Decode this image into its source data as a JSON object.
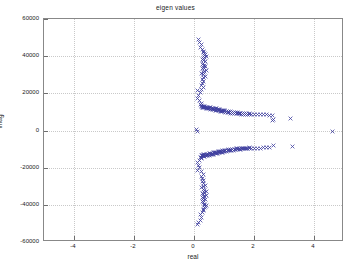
{
  "figure": {
    "title": "eigen values",
    "background_color": "#ffffff",
    "axes_color": "#888888",
    "grid_color": "#c9c9c9",
    "marker_color": "#4040a0",
    "marker_symbol": "x",
    "text_color": "#1a1a1a"
  },
  "axis_labels": {
    "x": "real",
    "y": "imag"
  },
  "chart_data": {
    "type": "scatter",
    "title": "eigen values",
    "xlabel": "real",
    "ylabel": "imag",
    "xlim": [
      -5,
      5
    ],
    "ylim": [
      -60000,
      60000
    ],
    "grid": true,
    "legend": false,
    "legend_position": "none",
    "xticks": [
      -4,
      -2,
      0,
      2,
      4
    ],
    "xticklabels": [
      "-4",
      "-2",
      "0",
      "2",
      "4"
    ],
    "yticks": [
      -60000,
      -40000,
      -20000,
      0,
      20000,
      40000,
      60000
    ],
    "yticklabels": [
      "-60000",
      "-40000",
      "-20000",
      "0",
      "20000",
      "40000",
      "60000"
    ],
    "marker": "x",
    "marker_color": "#4040a0",
    "series": [
      {
        "name": "eigenvalues",
        "points": [
          [
            0.14,
            49100
          ],
          [
            0.19,
            47600
          ],
          [
            0.25,
            46300
          ],
          [
            0.22,
            44900
          ],
          [
            0.29,
            43600
          ],
          [
            0.33,
            42600
          ],
          [
            0.31,
            41900
          ],
          [
            0.36,
            41300
          ],
          [
            0.38,
            40700
          ],
          [
            0.35,
            40200
          ],
          [
            0.4,
            39800
          ],
          [
            0.34,
            39300
          ],
          [
            0.3,
            38700
          ],
          [
            0.28,
            38100
          ],
          [
            0.33,
            37500
          ],
          [
            0.37,
            36900
          ],
          [
            0.31,
            36300
          ],
          [
            0.27,
            35700
          ],
          [
            0.35,
            35100
          ],
          [
            0.39,
            34600
          ],
          [
            0.33,
            34100
          ],
          [
            0.29,
            33600
          ],
          [
            0.36,
            33100
          ],
          [
            0.41,
            32500
          ],
          [
            0.34,
            31900
          ],
          [
            0.3,
            31300
          ],
          [
            0.26,
            30600
          ],
          [
            0.32,
            29900
          ],
          [
            0.37,
            29100
          ],
          [
            0.31,
            28300
          ],
          [
            0.27,
            27400
          ],
          [
            0.33,
            26500
          ],
          [
            0.29,
            25500
          ],
          [
            0.24,
            24400
          ],
          [
            0.3,
            23200
          ],
          [
            0.26,
            22000
          ],
          [
            0.13,
            21500
          ],
          [
            0.2,
            20600
          ],
          [
            0.16,
            19000
          ],
          [
            0.11,
            17400
          ],
          [
            0.19,
            15900
          ],
          [
            0.24,
            14600
          ],
          [
            0.21,
            13900
          ],
          [
            0.26,
            13400
          ],
          [
            0.3,
            13100
          ],
          [
            0.34,
            12900
          ],
          [
            0.28,
            12800
          ],
          [
            0.24,
            12700
          ],
          [
            0.38,
            12600
          ],
          [
            0.42,
            12500
          ],
          [
            0.33,
            12450
          ],
          [
            0.29,
            12400
          ],
          [
            0.46,
            12350
          ],
          [
            0.5,
            12300
          ],
          [
            0.36,
            12250
          ],
          [
            0.31,
            12200
          ],
          [
            0.54,
            12150
          ],
          [
            0.58,
            12100
          ],
          [
            0.4,
            12050
          ],
          [
            0.44,
            12000
          ],
          [
            0.62,
            11950
          ],
          [
            0.66,
            11900
          ],
          [
            0.48,
            11850
          ],
          [
            0.52,
            11800
          ],
          [
            0.7,
            11700
          ],
          [
            0.74,
            11600
          ],
          [
            0.56,
            11550
          ],
          [
            0.6,
            11500
          ],
          [
            0.78,
            11400
          ],
          [
            0.82,
            11300
          ],
          [
            0.64,
            11250
          ],
          [
            0.68,
            11200
          ],
          [
            0.86,
            11100
          ],
          [
            0.9,
            11000
          ],
          [
            0.72,
            10950
          ],
          [
            0.76,
            10900
          ],
          [
            0.94,
            10800
          ],
          [
            0.98,
            10700
          ],
          [
            0.8,
            10650
          ],
          [
            0.84,
            10600
          ],
          [
            1.02,
            10500
          ],
          [
            1.08,
            10400
          ],
          [
            0.88,
            10350
          ],
          [
            0.92,
            10300
          ],
          [
            1.14,
            10200
          ],
          [
            1.2,
            10100
          ],
          [
            0.96,
            10050
          ],
          [
            1.0,
            10000
          ],
          [
            1.26,
            9900
          ],
          [
            1.32,
            9800
          ],
          [
            1.05,
            9750
          ],
          [
            1.1,
            9700
          ],
          [
            1.38,
            9600
          ],
          [
            1.44,
            9500
          ],
          [
            1.15,
            9450
          ],
          [
            1.22,
            9400
          ],
          [
            1.5,
            9350
          ],
          [
            1.56,
            9300
          ],
          [
            1.28,
            9250
          ],
          [
            1.34,
            9200
          ],
          [
            1.62,
            9150
          ],
          [
            1.68,
            9100
          ],
          [
            1.4,
            9050
          ],
          [
            1.46,
            9000
          ],
          [
            1.76,
            8950
          ],
          [
            1.84,
            8900
          ],
          [
            1.52,
            8880
          ],
          [
            1.58,
            8860
          ],
          [
            1.92,
            8840
          ],
          [
            2.0,
            8800
          ],
          [
            1.64,
            8780
          ],
          [
            1.7,
            8760
          ],
          [
            2.1,
            8700
          ],
          [
            2.22,
            8650
          ],
          [
            1.78,
            8620
          ],
          [
            1.86,
            8600
          ],
          [
            2.3,
            8550
          ],
          [
            2.42,
            8450
          ],
          [
            2.52,
            8300
          ],
          [
            2.62,
            7900
          ],
          [
            2.66,
            6100
          ],
          [
            2.6,
            5300
          ],
          [
            3.22,
            6200
          ],
          [
            4.62,
            -500
          ],
          [
            0.08,
            400
          ],
          [
            0.1,
            -600
          ],
          [
            0.14,
            -49600
          ],
          [
            0.11,
            -50800
          ],
          [
            0.2,
            -48200
          ],
          [
            0.25,
            -46800
          ],
          [
            0.22,
            -45400
          ],
          [
            0.29,
            -44100
          ],
          [
            0.33,
            -43000
          ],
          [
            0.31,
            -42300
          ],
          [
            0.36,
            -41700
          ],
          [
            0.39,
            -41100
          ],
          [
            0.35,
            -40600
          ],
          [
            0.41,
            -40100
          ],
          [
            0.34,
            -39600
          ],
          [
            0.3,
            -39000
          ],
          [
            0.28,
            -38400
          ],
          [
            0.33,
            -37800
          ],
          [
            0.37,
            -37200
          ],
          [
            0.31,
            -36600
          ],
          [
            0.27,
            -36000
          ],
          [
            0.35,
            -35400
          ],
          [
            0.4,
            -34900
          ],
          [
            0.33,
            -34400
          ],
          [
            0.29,
            -33900
          ],
          [
            0.36,
            -33400
          ],
          [
            0.42,
            -32800
          ],
          [
            0.34,
            -32200
          ],
          [
            0.3,
            -31600
          ],
          [
            0.26,
            -30900
          ],
          [
            0.32,
            -30200
          ],
          [
            0.38,
            -29400
          ],
          [
            0.31,
            -28600
          ],
          [
            0.27,
            -27700
          ],
          [
            0.33,
            -26800
          ],
          [
            0.29,
            -25800
          ],
          [
            0.24,
            -24700
          ],
          [
            0.3,
            -23500
          ],
          [
            0.26,
            -22300
          ],
          [
            0.13,
            -21300
          ],
          [
            0.18,
            -20100
          ],
          [
            0.15,
            -18700
          ],
          [
            0.11,
            -17200
          ],
          [
            0.19,
            -16200
          ],
          [
            0.24,
            -15300
          ],
          [
            0.21,
            -14700
          ],
          [
            0.26,
            -14300
          ],
          [
            0.3,
            -14000
          ],
          [
            0.34,
            -13800
          ],
          [
            0.28,
            -13700
          ],
          [
            0.24,
            -13600
          ],
          [
            0.38,
            -13500
          ],
          [
            0.42,
            -13400
          ],
          [
            0.33,
            -13350
          ],
          [
            0.29,
            -13300
          ],
          [
            0.46,
            -13250
          ],
          [
            0.5,
            -13200
          ],
          [
            0.36,
            -13150
          ],
          [
            0.31,
            -13100
          ],
          [
            0.54,
            -13050
          ],
          [
            0.58,
            -13000
          ],
          [
            0.4,
            -12950
          ],
          [
            0.44,
            -12900
          ],
          [
            0.62,
            -12800
          ],
          [
            0.66,
            -12700
          ],
          [
            0.48,
            -12650
          ],
          [
            0.52,
            -12600
          ],
          [
            0.7,
            -12500
          ],
          [
            0.74,
            -12400
          ],
          [
            0.56,
            -12350
          ],
          [
            0.6,
            -12300
          ],
          [
            0.78,
            -12200
          ],
          [
            0.82,
            -12100
          ],
          [
            0.64,
            -12050
          ],
          [
            0.68,
            -12000
          ],
          [
            0.86,
            -11900
          ],
          [
            0.9,
            -11800
          ],
          [
            0.72,
            -11750
          ],
          [
            0.76,
            -11700
          ],
          [
            0.94,
            -11600
          ],
          [
            0.98,
            -11500
          ],
          [
            0.8,
            -11450
          ],
          [
            0.84,
            -11400
          ],
          [
            1.02,
            -11300
          ],
          [
            1.08,
            -11200
          ],
          [
            0.88,
            -11150
          ],
          [
            0.92,
            -11100
          ],
          [
            1.14,
            -11000
          ],
          [
            1.2,
            -10900
          ],
          [
            0.96,
            -10850
          ],
          [
            1.0,
            -10800
          ],
          [
            1.26,
            -10700
          ],
          [
            1.32,
            -10600
          ],
          [
            1.05,
            -10550
          ],
          [
            1.1,
            -10500
          ],
          [
            1.38,
            -10400
          ],
          [
            1.44,
            -10300
          ],
          [
            1.15,
            -10250
          ],
          [
            1.22,
            -10200
          ],
          [
            1.5,
            -10150
          ],
          [
            1.56,
            -10100
          ],
          [
            1.28,
            -10050
          ],
          [
            1.34,
            -10000
          ],
          [
            1.62,
            -9950
          ],
          [
            1.68,
            -9900
          ],
          [
            1.4,
            -9850
          ],
          [
            1.46,
            -9800
          ],
          [
            1.76,
            -9750
          ],
          [
            1.84,
            -9700
          ],
          [
            1.52,
            -9680
          ],
          [
            1.58,
            -9660
          ],
          [
            1.92,
            -9640
          ],
          [
            2.0,
            -9600
          ],
          [
            1.64,
            -9580
          ],
          [
            1.7,
            -9560
          ],
          [
            2.1,
            -9500
          ],
          [
            2.22,
            -9450
          ],
          [
            1.78,
            -9420
          ],
          [
            1.86,
            -9400
          ],
          [
            2.3,
            -9350
          ],
          [
            2.42,
            -9300
          ],
          [
            2.52,
            -9250
          ],
          [
            2.66,
            -8200
          ],
          [
            3.28,
            -8400
          ]
        ]
      }
    ]
  }
}
